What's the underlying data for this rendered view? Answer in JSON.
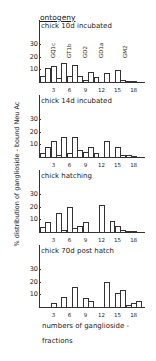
{
  "title": "ontogeny",
  "ylabel": "% distribution of ganglioside - bound Neu Ac",
  "xlabel_line1": "numbers of ganglioside -",
  "xlabel_line2": "fractions",
  "ganglioside_labels": [
    "GQ1c",
    "GT1b",
    "GD2",
    "GD1a",
    "GM2"
  ],
  "chart_data": [
    {
      "type": "bar",
      "title": "chick 10d incubated",
      "xlabel": "numbers of ganglioside-fractions",
      "ylabel": "% distribution of ganglioside-bound Neu Ac",
      "ylim": [
        0,
        30
      ],
      "yticks": [
        10,
        20,
        30
      ],
      "xticks": [
        3,
        6,
        9,
        12,
        15,
        18
      ],
      "categories": [
        1,
        2,
        3,
        4,
        5,
        6,
        7,
        8,
        9,
        10,
        11,
        12,
        13,
        14,
        15,
        16,
        17,
        18
      ],
      "values": [
        5,
        11,
        13,
        3,
        15,
        5,
        14,
        5,
        2,
        8,
        4,
        0,
        7,
        0,
        10,
        1.5,
        1,
        0.5
      ],
      "annotations": [
        "GQ1c",
        "GT1b",
        "GD2",
        "GD1a",
        "GM2"
      ]
    },
    {
      "type": "bar",
      "title": "chick 14d incubated",
      "ylim": [
        0,
        30
      ],
      "yticks": [
        10,
        20,
        30
      ],
      "xticks": [
        3,
        6,
        9,
        12,
        15,
        18
      ],
      "categories": [
        1,
        2,
        3,
        4,
        5,
        6,
        7,
        8,
        9,
        10,
        11,
        12,
        13,
        14,
        15,
        16,
        17,
        18
      ],
      "values": [
        3,
        8,
        13,
        2,
        16,
        3,
        16,
        6,
        4,
        8,
        3,
        0,
        13,
        0,
        8,
        2,
        1.5,
        0.5
      ]
    },
    {
      "type": "bar",
      "title": "chick hatching",
      "ylim": [
        0,
        30
      ],
      "yticks": [
        10,
        20,
        30
      ],
      "xticks": [
        3,
        6,
        9,
        12,
        15,
        18
      ],
      "categories": [
        1,
        2,
        3,
        4,
        5,
        6,
        7,
        8,
        9,
        10,
        11,
        12,
        13,
        14,
        15,
        16,
        17,
        18
      ],
      "values": [
        4,
        8,
        0,
        15,
        2,
        20,
        3,
        5,
        8,
        0,
        0,
        22,
        0,
        9,
        5,
        1.5,
        1,
        0.5
      ]
    },
    {
      "type": "bar",
      "title": "chick 70d post hatch",
      "ylim": [
        0,
        30
      ],
      "yticks": [
        10,
        20,
        30
      ],
      "xticks": [
        3,
        6,
        9,
        12,
        15,
        18
      ],
      "categories": [
        1,
        2,
        3,
        4,
        5,
        6,
        7,
        8,
        9,
        10,
        11,
        12,
        13,
        14,
        15,
        16,
        17,
        18
      ],
      "values": [
        0,
        0,
        3,
        0,
        8,
        0,
        16,
        0,
        7,
        5,
        0,
        0,
        20,
        0,
        11,
        14,
        2,
        3.5,
        5
      ]
    }
  ]
}
